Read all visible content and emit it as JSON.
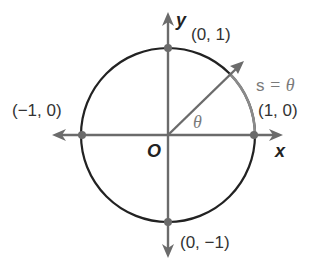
{
  "diagram": {
    "axes": {
      "x_label": "x",
      "y_label": "y",
      "origin_label": "O"
    },
    "points": [
      {
        "name": "top",
        "label": "(0, 1)"
      },
      {
        "name": "left",
        "label": "(−1, 0)"
      },
      {
        "name": "right",
        "label": "(1, 0)"
      },
      {
        "name": "bottom",
        "label": "(0, −1)"
      }
    ],
    "angle_label": "θ",
    "arc_label_s": "s",
    "arc_label_eq": " = θ",
    "colors": {
      "circle": "#222222",
      "axes": "#6b6b6b",
      "arc": "#8a8a8a",
      "ray": "#6b6b6b",
      "point": "#6b6b6b",
      "text_gray": "#7a7a7a"
    }
  }
}
